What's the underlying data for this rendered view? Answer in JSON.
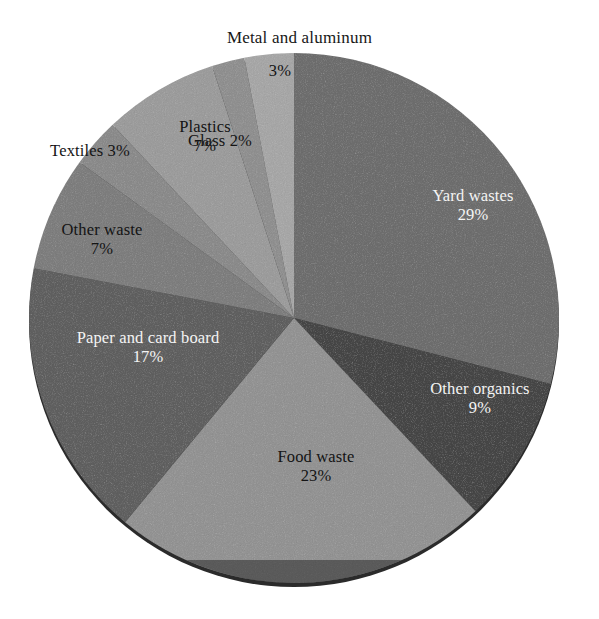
{
  "chart_data": {
    "type": "pie",
    "title": "",
    "subtitle": "",
    "xlabel": "",
    "ylabel": "",
    "legend_position": "none",
    "grid": false,
    "units": "percent",
    "start_angle_deg": 0,
    "direction": "clockwise",
    "categories": [
      "Yard wastes",
      "Other organics",
      "Food waste",
      "Paper and card board",
      "Other waste",
      "Textiles",
      "Plastics",
      "Glass",
      "Metal and aluminum"
    ],
    "values": [
      29,
      9,
      23,
      17,
      7,
      3,
      7,
      2,
      3
    ],
    "slices": [
      {
        "name": "Yard wastes",
        "value": 29,
        "value_label": "29%",
        "color": "#6d6d6d",
        "label_color": "#f4f4f4",
        "label_placement": "inside"
      },
      {
        "name": "Other organics",
        "value": 9,
        "value_label": "9%",
        "color": "#454545",
        "label_color": "#f4f4f4",
        "label_placement": "inside"
      },
      {
        "name": "Food waste",
        "value": 23,
        "value_label": "23%",
        "color": "#929292",
        "label_color": "#141414",
        "label_placement": "inside"
      },
      {
        "name": "Paper and card board",
        "value": 17,
        "value_label": "17%",
        "color": "#5f5f5f",
        "label_color": "#f4f4f4",
        "label_placement": "inside"
      },
      {
        "name": "Other waste",
        "value": 7,
        "value_label": "7%",
        "color": "#7d7d7d",
        "label_color": "#141414",
        "label_placement": "edge"
      },
      {
        "name": "Textiles",
        "value": 3,
        "value_label": "3%",
        "color": "#8a8a8a",
        "label_color": "#141414",
        "label_placement": "edge"
      },
      {
        "name": "Plastics",
        "value": 7,
        "value_label": "7%",
        "color": "#9b9b9b",
        "label_color": "#141414",
        "label_placement": "inside"
      },
      {
        "name": "Glass",
        "value": 2,
        "value_label": "2%",
        "color": "#8f8f8f",
        "label_color": "#141414",
        "label_placement": "edge"
      },
      {
        "name": "Metal and aluminum",
        "value": 3,
        "value_label": "3%",
        "color": "#a6a6a6",
        "label_color": "#141414",
        "label_placement": "outside"
      }
    ],
    "geometry": {
      "center_x": 294,
      "center_y": 318,
      "radius": 265,
      "shadow_rim_color": "#2e2e2e"
    }
  },
  "labels": {
    "metal_outside": "Metal and aluminum",
    "metal_pct": "3%",
    "glass": "Glass 2%",
    "plastics_name": "Plastics",
    "plastics_pct": "7%",
    "textiles": "Textiles 3%",
    "other_waste_name": "Other waste",
    "other_waste_pct": "7%",
    "paper_name": "Paper and card board",
    "paper_pct": "17%",
    "food_name": "Food waste",
    "food_pct": "23%",
    "organics_name": "Other organics",
    "organics_pct": "9%",
    "yard_name": "Yard wastes",
    "yard_pct": "29%"
  },
  "colors": {
    "background": "#ffffff",
    "text_dark": "#141414",
    "text_light": "#f4f4f4"
  }
}
